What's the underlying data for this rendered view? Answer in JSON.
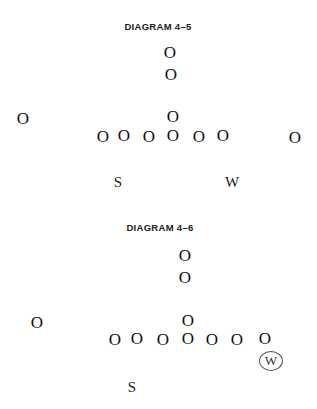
{
  "diagrams": [
    {
      "title": "DIAGRAM 4–5",
      "title_pos": [
        158,
        27
      ],
      "symbol": "O",
      "players": [
        {
          "role": "deep-back",
          "x": 170,
          "y": 52
        },
        {
          "role": "back",
          "x": 171,
          "y": 74
        },
        {
          "role": "left-end",
          "x": 23,
          "y": 118
        },
        {
          "role": "center-back",
          "x": 173,
          "y": 116
        },
        {
          "role": "line",
          "x": 103,
          "y": 136
        },
        {
          "role": "line",
          "x": 124,
          "y": 135
        },
        {
          "role": "line",
          "x": 149,
          "y": 136
        },
        {
          "role": "line",
          "x": 173,
          "y": 135
        },
        {
          "role": "line",
          "x": 199,
          "y": 136
        },
        {
          "role": "line",
          "x": 223,
          "y": 135
        },
        {
          "role": "right-end",
          "x": 295,
          "y": 137
        }
      ],
      "labels": [
        {
          "text": "S",
          "x": 118,
          "y": 182,
          "circled": false
        },
        {
          "text": "W",
          "x": 232,
          "y": 182,
          "circled": false
        }
      ]
    },
    {
      "title": "DIAGRAM 4–6",
      "title_pos": [
        160,
        228
      ],
      "symbol": "O",
      "players": [
        {
          "role": "deep-back",
          "x": 185,
          "y": 255
        },
        {
          "role": "back",
          "x": 185,
          "y": 277
        },
        {
          "role": "left-end",
          "x": 37,
          "y": 322
        },
        {
          "role": "center-back",
          "x": 188,
          "y": 320
        },
        {
          "role": "line",
          "x": 115,
          "y": 339
        },
        {
          "role": "line",
          "x": 137,
          "y": 338
        },
        {
          "role": "line",
          "x": 163,
          "y": 339
        },
        {
          "role": "line",
          "x": 188,
          "y": 338
        },
        {
          "role": "line",
          "x": 212,
          "y": 339
        },
        {
          "role": "line",
          "x": 237,
          "y": 339
        },
        {
          "role": "line",
          "x": 265,
          "y": 338
        }
      ],
      "labels": [
        {
          "text": "S",
          "x": 132,
          "y": 387,
          "circled": false
        },
        {
          "text": "W",
          "x": 271,
          "y": 361,
          "circled": true
        }
      ]
    }
  ]
}
